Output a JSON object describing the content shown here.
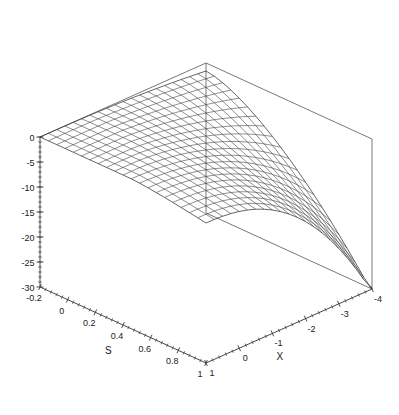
{
  "figure": {
    "type": "3d-surface-wireframe",
    "background_color": "#ffffff",
    "line_color": "#333333",
    "box_color": "#555555",
    "width": 399,
    "height": 415
  },
  "chart_data": {
    "type": "line",
    "subtype": "3d-wireframe-surface",
    "title": "",
    "xlabel": "S",
    "ylabel": "X",
    "zlabel": "",
    "grid": false,
    "legend": null,
    "axes": {
      "s_axis": {
        "label": "S",
        "min": -0.2,
        "max": 1,
        "ticks": [
          -0.2,
          0,
          0.2,
          0.4,
          0.6,
          0.8,
          1
        ],
        "tick_labels": [
          "-0.2",
          "0",
          "0.2",
          "0.4",
          "0.6",
          "0.8",
          "1"
        ],
        "minor_ticks_per_interval": 4
      },
      "x_axis": {
        "label": "X",
        "min": 1,
        "max": -4,
        "ticks": [
          1,
          0,
          -1,
          -2,
          -3,
          -4
        ],
        "tick_labels": [
          "1",
          "0",
          "-1",
          "-2",
          "-3",
          "-4"
        ],
        "minor_ticks_per_interval": 4
      },
      "z_axis": {
        "label": "",
        "min": -30,
        "max": 0,
        "ticks": [
          0,
          -5,
          -10,
          -15,
          -20,
          -25,
          -30
        ],
        "tick_labels": [
          "0",
          "-5",
          "-10",
          "-15",
          "-20",
          "-25",
          "-30"
        ],
        "minor_ticks_per_interval": 5
      }
    },
    "mesh": {
      "s_divisions": 20,
      "x_divisions": 20,
      "description": "Saddle-shaped surface sheet, near 0 along the back-left ridge, curving down to about -30 at the front-right corner where S=1 and X=-4."
    },
    "surface_corner_values": {
      "s_min_x_min": 0,
      "s_min_x_max": -2,
      "s_max_x_min": -4,
      "s_max_x_max": -30
    }
  },
  "labels": {
    "z_ticks": [
      "0",
      "-5",
      "-10",
      "-15",
      "-20",
      "-25",
      "-30"
    ],
    "s_ticks": [
      "-0.2",
      "0",
      "0.2",
      "0.4",
      "0.6",
      "0.8",
      "1"
    ],
    "x_ticks": [
      "1",
      "0",
      "-1",
      "-2",
      "-3",
      "-4"
    ],
    "s_title": "S",
    "x_title": "X"
  }
}
